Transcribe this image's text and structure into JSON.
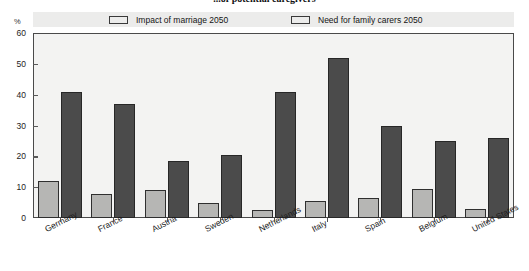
{
  "chart_data": {
    "type": "bar",
    "title": "...of potential caregivers",
    "ylabel": "%",
    "xlabel": "",
    "ylim": [
      0,
      60
    ],
    "yticks": [
      0,
      10,
      20,
      30,
      40,
      50,
      60
    ],
    "grid": false,
    "legend_position": "top",
    "categories": [
      "Germany",
      "France",
      "Austria",
      "Sweden",
      "Netherlands",
      "Italy",
      "Spain",
      "Belgium",
      "United States"
    ],
    "series": [
      {
        "name": "Impact of marriage 2050",
        "color": "#b6b6b4",
        "values": [
          12,
          7.8,
          9,
          5,
          2.5,
          5.5,
          6.5,
          9.5,
          3
        ]
      },
      {
        "name": "Need for family carers 2050",
        "color": "#4b4b4b",
        "values": [
          41,
          37,
          18.5,
          20.5,
          41,
          52,
          30,
          25,
          26
        ]
      }
    ]
  },
  "legend": {
    "items": [
      {
        "label": "Impact of marriage 2050",
        "color": "#b6b6b4"
      },
      {
        "label": "Need for family carers 2050",
        "color": "#4b4b4b"
      }
    ]
  }
}
